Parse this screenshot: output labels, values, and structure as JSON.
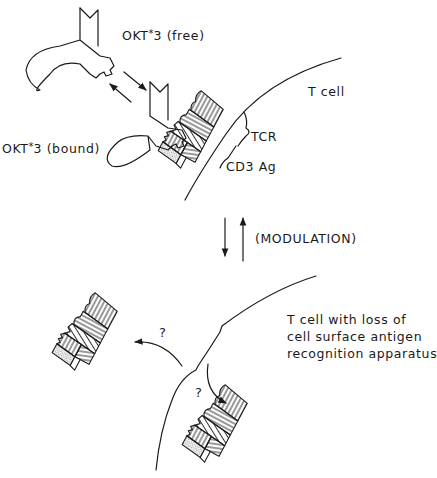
{
  "diagram": {
    "colors": {
      "ink": "#1a1a1a",
      "background": "#ffffff"
    },
    "labels": {
      "okt3_free_prefix": "OKT",
      "okt3_free_star": "*",
      "okt3_free_suffix": "3 (free)",
      "okt3_bound_prefix": "OKT",
      "okt3_bound_star": "*",
      "okt3_bound_suffix": "3 (bound)",
      "t_cell": "T cell",
      "tcr": "TCR",
      "cd3": "CD3 Ag",
      "modulation": "(MODULATION)",
      "t_cell_loss": "T cell with loss of\ncell surface antigen\nrecognition apparatus",
      "question_upper": "?",
      "question_lower": "?"
    },
    "nodes": [
      {
        "id": "okt3-free",
        "label": "OKT*3 (free)",
        "kind": "antibody"
      },
      {
        "id": "okt3-bound",
        "label": "OKT*3 (bound)",
        "kind": "antibody"
      },
      {
        "id": "tcr-cd3-complex",
        "label": "TCR / CD3 Ag",
        "kind": "receptor-complex"
      },
      {
        "id": "t-cell",
        "label": "T cell",
        "kind": "cell"
      },
      {
        "id": "t-cell-modulated",
        "label": "T cell with loss of cell surface antigen recognition apparatus",
        "kind": "cell"
      },
      {
        "id": "shed-complex",
        "label": "?",
        "kind": "receptor-complex"
      },
      {
        "id": "internalized-complex",
        "label": "?",
        "kind": "receptor-complex"
      }
    ],
    "edges": [
      {
        "from": "okt3-free",
        "to": "okt3-bound",
        "type": "reversible-binding"
      },
      {
        "from": "t-cell",
        "to": "t-cell-modulated",
        "type": "reversible",
        "label": "(MODULATION)"
      },
      {
        "from": "t-cell-modulated",
        "to": "shed-complex",
        "label": "?"
      },
      {
        "from": "t-cell-modulated",
        "to": "internalized-complex",
        "label": "?"
      }
    ]
  }
}
